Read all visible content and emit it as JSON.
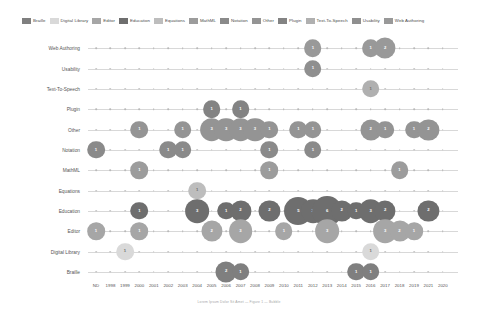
{
  "chart_data": {
    "type": "scatter",
    "title": "",
    "xlabel": "",
    "ylabel": "",
    "grid": true,
    "legend_position": "top",
    "categories_x": [
      "ND",
      "1998",
      "1999",
      "2000",
      "2001",
      "2002",
      "2003",
      "2004",
      "2005",
      "2006",
      "2007",
      "2008",
      "2009",
      "2010",
      "2011",
      "2012",
      "2013",
      "2014",
      "2015",
      "2016",
      "2017",
      "2018",
      "2019",
      "2021",
      "2020"
    ],
    "categories_y": [
      "Web Authoring",
      "Usability",
      "Text-To-Speech",
      "Plugin",
      "Other",
      "Notation",
      "MathML",
      "Equations",
      "Education",
      "Editor",
      "Digital Library",
      "Braille"
    ],
    "legend": [
      {
        "label": "Braille",
        "color": "#7f7f7f"
      },
      {
        "label": "Digital Library",
        "color": "#d9d9d9"
      },
      {
        "label": "Editor",
        "color": "#a6a6a6"
      },
      {
        "label": "Education",
        "color": "#6e6e6e"
      },
      {
        "label": "Equations",
        "color": "#bdbdbd"
      },
      {
        "label": "MathML",
        "color": "#9c9c9c"
      },
      {
        "label": "Notation",
        "color": "#8a8a8a"
      },
      {
        "label": "Other",
        "color": "#949494"
      },
      {
        "label": "Plugin",
        "color": "#838383"
      },
      {
        "label": "Text-To-Speech",
        "color": "#b0b0b0"
      },
      {
        "label": "Usability",
        "color": "#8f8f8f"
      },
      {
        "label": "Web Authoring",
        "color": "#999999"
      }
    ],
    "points": [
      {
        "series": "Web Authoring",
        "x": "2012",
        "value": 1
      },
      {
        "series": "Web Authoring",
        "x": "2016",
        "value": 1
      },
      {
        "series": "Web Authoring",
        "x": "2017",
        "value": 2
      },
      {
        "series": "Usability",
        "x": "2012",
        "value": 1
      },
      {
        "series": "Text-To-Speech",
        "x": "2016",
        "value": 1
      },
      {
        "series": "Plugin",
        "x": "2005",
        "value": 1
      },
      {
        "series": "Plugin",
        "x": "2007",
        "value": 1
      },
      {
        "series": "Other",
        "x": "2000",
        "value": 1
      },
      {
        "series": "Other",
        "x": "2003",
        "value": 1
      },
      {
        "series": "Other",
        "x": "2005",
        "value": 3
      },
      {
        "series": "Other",
        "x": "2006",
        "value": 3
      },
      {
        "series": "Other",
        "x": "2007",
        "value": 3
      },
      {
        "series": "Other",
        "x": "2008",
        "value": 3
      },
      {
        "series": "Other",
        "x": "2009",
        "value": 1
      },
      {
        "series": "Other",
        "x": "2011",
        "value": 1
      },
      {
        "series": "Other",
        "x": "2012",
        "value": 1
      },
      {
        "series": "Other",
        "x": "2016",
        "value": 2
      },
      {
        "series": "Other",
        "x": "2017",
        "value": 1
      },
      {
        "series": "Other",
        "x": "2019",
        "value": 1
      },
      {
        "series": "Other",
        "x": "2021",
        "value": 2
      },
      {
        "series": "Notation",
        "x": "ND",
        "value": 1
      },
      {
        "series": "Notation",
        "x": "2002",
        "value": 1
      },
      {
        "series": "Notation",
        "x": "2003",
        "value": 1
      },
      {
        "series": "Notation",
        "x": "2009",
        "value": 1
      },
      {
        "series": "Notation",
        "x": "2012",
        "value": 1
      },
      {
        "series": "MathML",
        "x": "2000",
        "value": 1
      },
      {
        "series": "MathML",
        "x": "2009",
        "value": 1
      },
      {
        "series": "MathML",
        "x": "2018",
        "value": 1
      },
      {
        "series": "Equations",
        "x": "2004",
        "value": 1
      },
      {
        "series": "Education",
        "x": "2000",
        "value": 1
      },
      {
        "series": "Education",
        "x": "2004",
        "value": 3
      },
      {
        "series": "Education",
        "x": "2006",
        "value": 1
      },
      {
        "series": "Education",
        "x": "2007",
        "value": 2
      },
      {
        "series": "Education",
        "x": "2009",
        "value": 2
      },
      {
        "series": "Education",
        "x": "2011",
        "value": 5
      },
      {
        "series": "Education",
        "x": "2012",
        "value": 3
      },
      {
        "series": "Education",
        "x": "2013",
        "value": 6
      },
      {
        "series": "Education",
        "x": "2014",
        "value": 2
      },
      {
        "series": "Education",
        "x": "2015",
        "value": 1
      },
      {
        "series": "Education",
        "x": "2016",
        "value": 3
      },
      {
        "series": "Education",
        "x": "2017",
        "value": 2
      },
      {
        "series": "Education",
        "x": "2021",
        "value": 2
      },
      {
        "series": "Editor",
        "x": "ND",
        "value": 1
      },
      {
        "series": "Editor",
        "x": "2000",
        "value": 1
      },
      {
        "series": "Editor",
        "x": "2005",
        "value": 2
      },
      {
        "series": "Editor",
        "x": "2007",
        "value": 3
      },
      {
        "series": "Editor",
        "x": "2010",
        "value": 1
      },
      {
        "series": "Editor",
        "x": "2013",
        "value": 3
      },
      {
        "series": "Editor",
        "x": "2017",
        "value": 3
      },
      {
        "series": "Editor",
        "x": "2018",
        "value": 2
      },
      {
        "series": "Editor",
        "x": "2019",
        "value": 1
      },
      {
        "series": "Digital Library",
        "x": "1999",
        "value": 1
      },
      {
        "series": "Digital Library",
        "x": "2016",
        "value": 1
      },
      {
        "series": "Braille",
        "x": "2006",
        "value": 2
      },
      {
        "series": "Braille",
        "x": "2007",
        "value": 1
      },
      {
        "series": "Braille",
        "x": "2015",
        "value": 1
      },
      {
        "series": "Braille",
        "x": "2016",
        "value": 1
      }
    ]
  },
  "caption": {
    "text": "Lorem Ipsum Dolor Sit Amet — Figure 1 — Bubble"
  }
}
